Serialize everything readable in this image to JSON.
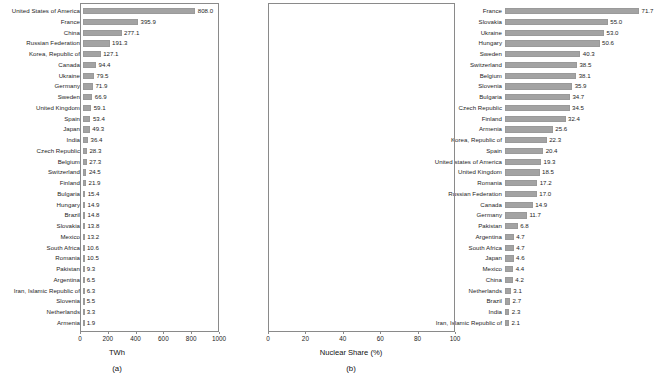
{
  "figure": {
    "background": "#ffffff",
    "bar_color": "#a3a3a3",
    "frame_color": "#8a8a8a"
  },
  "panels": [
    {
      "caption": "(a)",
      "xlabel": "TWh"
    },
    {
      "caption": "(b)",
      "xlabel": "Nuclear Share (%)"
    }
  ],
  "chart_data": [
    {
      "type": "bar",
      "orientation": "horizontal",
      "title": "",
      "panel": "(a)",
      "xlabel": "TWh",
      "ylabel": "",
      "xlim": [
        0,
        1000
      ],
      "xticks": [
        0,
        200,
        400,
        600,
        800,
        1000
      ],
      "xtick_labels": [
        "0",
        "200",
        "400",
        "600",
        "800",
        "1000"
      ],
      "grid": false,
      "legend": "none",
      "categories": [
        "United States of America",
        "France",
        "China",
        "Russian Federation",
        "Korea, Republic of",
        "Canada",
        "Ukraine",
        "Germany",
        "Sweden",
        "United Kingdom",
        "Spain",
        "Japan",
        "India",
        "Czech Republic",
        "Belgium",
        "Switzerland",
        "Finland",
        "Bulgaria",
        "Hungary",
        "Brazil",
        "Slovakia",
        "Mexico",
        "South Africa",
        "Romania",
        "Pakistan",
        "Argentina",
        "Iran, Islamic Republic of",
        "Slovenia",
        "Netherlands",
        "Armenia"
      ],
      "values": [
        808.0,
        395.9,
        277.1,
        191.3,
        127.1,
        94.4,
        79.5,
        71.9,
        66.9,
        59.1,
        53.4,
        49.3,
        36.4,
        28.3,
        27.3,
        24.5,
        21.9,
        15.4,
        14.9,
        14.8,
        13.8,
        13.2,
        10.6,
        10.5,
        9.3,
        6.5,
        6.3,
        5.5,
        3.3,
        1.9
      ],
      "value_labels": [
        "808.0",
        "395.9",
        "277.1",
        "191.3",
        "127.1",
        "94.4",
        "79.5",
        "71.9",
        "66.9",
        "59.1",
        "53.4",
        "49.3",
        "36.4",
        "28.3",
        "27.3",
        "24.5",
        "21.9",
        "15.4",
        "14.9",
        "14.8",
        "13.8",
        "13.2",
        "10.6",
        "10.5",
        "9.3",
        "6.5",
        "6.3",
        "5.5",
        "3.3",
        "1.9"
      ]
    },
    {
      "type": "bar",
      "orientation": "horizontal",
      "title": "",
      "panel": "(b)",
      "xlabel": "Nuclear Share (%)",
      "ylabel": "",
      "xlim": [
        0,
        100
      ],
      "xticks": [
        0,
        20,
        40,
        60,
        80,
        100
      ],
      "xtick_labels": [
        "0",
        "20",
        "40",
        "60",
        "80",
        "100"
      ],
      "grid": false,
      "legend": "none",
      "categories": [
        "France",
        "Slovakia",
        "Ukraine",
        "Hungary",
        "Sweden",
        "Switzerland",
        "Belgium",
        "Slovenia",
        "Bulgaria",
        "Czech Republic",
        "Finland",
        "Armenia",
        "Korea, Republic of",
        "Spain",
        "United states of America",
        "United Kingdom",
        "Romania",
        "Russian Federation",
        "Canada",
        "Germany",
        "Pakistan",
        "Argentina",
        "South Africa",
        "Japan",
        "Mexico",
        "China",
        "Netherlands",
        "Brazil",
        "India",
        "Iran, Islamic Republic of"
      ],
      "values": [
        71.7,
        55.0,
        53.0,
        50.6,
        40.3,
        38.5,
        38.1,
        35.9,
        34.7,
        34.5,
        32.4,
        25.6,
        22.3,
        20.4,
        19.3,
        18.5,
        17.2,
        17.0,
        14.9,
        11.7,
        6.8,
        4.7,
        4.7,
        4.6,
        4.4,
        4.2,
        3.1,
        2.7,
        2.3,
        2.1
      ],
      "value_labels": [
        "71.7",
        "55.0",
        "53.0",
        "50.6",
        "40.3",
        "38.5",
        "38.1",
        "35.9",
        "34.7",
        "34.5",
        "32.4",
        "25.6",
        "22.3",
        "20.4",
        "19.3",
        "18.5",
        "17.2",
        "17.0",
        "14.9",
        "11.7",
        "6.8",
        "4.7",
        "4.7",
        "4.6",
        "4.4",
        "4.2",
        "3.1",
        "2.7",
        "2.3",
        "2.1"
      ]
    }
  ]
}
